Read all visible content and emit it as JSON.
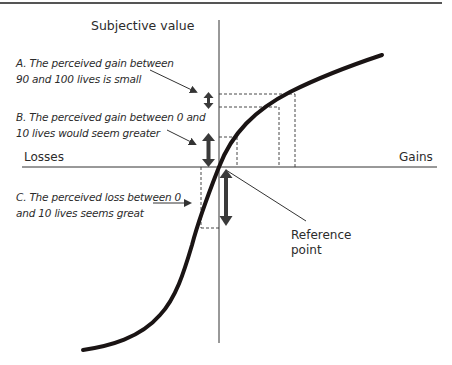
{
  "diagram": {
    "y_axis_label": "Subjective value",
    "x_axis_left_label": "Losses",
    "x_axis_right_label": "Gains",
    "origin_label": [
      "Reference",
      "point"
    ],
    "annotations": {
      "a": [
        "A. The perceived gain between",
        "90 and 100 lives is small"
      ],
      "b": [
        "B. The perceived gain between 0 and",
        "10 lives would seem greater"
      ],
      "c": [
        "C. The perceived loss between 0",
        "and 10 lives seems great"
      ]
    },
    "colors": {
      "curve": "#1a1414",
      "axis": "#333333",
      "arrow": "#3a3a3a",
      "dashed": "#333333"
    }
  }
}
